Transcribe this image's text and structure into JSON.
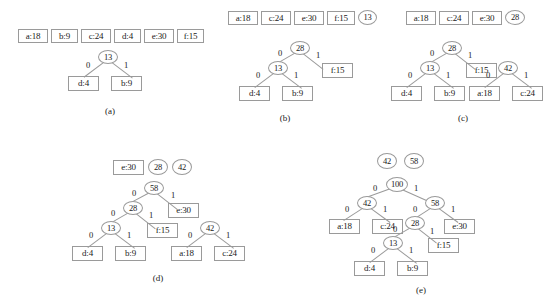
{
  "figure": {
    "width": 545,
    "height": 304,
    "colors": {
      "stroke": "#9a9a9a",
      "text": "#1a1a1a",
      "background": "#ffffff"
    }
  },
  "symbols": [
    {
      "label": "a:18",
      "char": "a",
      "freq": 18
    },
    {
      "label": "b:9",
      "char": "b",
      "freq": 9
    },
    {
      "label": "c:24",
      "char": "c",
      "freq": 24
    },
    {
      "label": "d:4",
      "char": "d",
      "freq": 4
    },
    {
      "label": "e:30",
      "char": "e",
      "freq": 30
    },
    {
      "label": "f:15",
      "char": "f",
      "freq": 15
    }
  ],
  "bits": {
    "zero": "0",
    "one": "1"
  },
  "panels": [
    {
      "id": "a",
      "caption": "(a)",
      "queue": [
        {
          "kind": "box",
          "label": "a:18"
        },
        {
          "kind": "box",
          "label": "b:9"
        },
        {
          "kind": "box",
          "label": "c:24"
        },
        {
          "kind": "box",
          "label": "d:4"
        },
        {
          "kind": "box",
          "label": "e:30"
        },
        {
          "kind": "box",
          "label": "f:15"
        }
      ],
      "trees": [
        {
          "root": "13",
          "nodes": [
            {
              "label": "13"
            }
          ],
          "leaves": [
            {
              "label": "d:4"
            },
            {
              "label": "b:9"
            }
          ]
        }
      ]
    },
    {
      "id": "b",
      "caption": "(b)",
      "queue": [
        {
          "kind": "box",
          "label": "a:18"
        },
        {
          "kind": "box",
          "label": "c:24"
        },
        {
          "kind": "box",
          "label": "e:30"
        },
        {
          "kind": "box",
          "label": "f:15"
        },
        {
          "kind": "node",
          "label": "13"
        }
      ],
      "trees": [
        {
          "root": "28",
          "nodes": [
            {
              "label": "28"
            },
            {
              "label": "13"
            }
          ],
          "leaves": [
            {
              "label": "d:4"
            },
            {
              "label": "b:9"
            },
            {
              "label": "f:15"
            }
          ]
        }
      ]
    },
    {
      "id": "c",
      "caption": "(c)",
      "queue": [
        {
          "kind": "box",
          "label": "a:18"
        },
        {
          "kind": "box",
          "label": "c:24"
        },
        {
          "kind": "box",
          "label": "e:30"
        },
        {
          "kind": "node",
          "label": "28"
        }
      ],
      "trees": [
        {
          "root": "28",
          "nodes": [
            {
              "label": "28"
            },
            {
              "label": "13"
            }
          ],
          "leaves": [
            {
              "label": "d:4"
            },
            {
              "label": "b:9"
            },
            {
              "label": "f:15"
            }
          ]
        },
        {
          "root": "42",
          "nodes": [
            {
              "label": "42"
            }
          ],
          "leaves": [
            {
              "label": "a:18"
            },
            {
              "label": "c:24"
            }
          ]
        }
      ]
    },
    {
      "id": "d",
      "caption": "(d)",
      "queue": [
        {
          "kind": "box",
          "label": "e:30"
        },
        {
          "kind": "node",
          "label": "28"
        },
        {
          "kind": "node",
          "label": "42"
        }
      ],
      "trees": [
        {
          "root": "58",
          "nodes": [
            {
              "label": "58"
            },
            {
              "label": "28"
            },
            {
              "label": "13"
            }
          ],
          "leaves": [
            {
              "label": "d:4"
            },
            {
              "label": "b:9"
            },
            {
              "label": "f:15"
            },
            {
              "label": "e:30"
            }
          ]
        },
        {
          "root": "42",
          "nodes": [
            {
              "label": "42"
            }
          ],
          "leaves": [
            {
              "label": "a:18"
            },
            {
              "label": "c:24"
            }
          ]
        }
      ]
    },
    {
      "id": "e",
      "caption": "(e)",
      "queue": [
        {
          "kind": "node",
          "label": "42"
        },
        {
          "kind": "node",
          "label": "58"
        }
      ],
      "trees": [
        {
          "root": "100",
          "nodes": [
            {
              "label": "100"
            },
            {
              "label": "42"
            },
            {
              "label": "58"
            },
            {
              "label": "28"
            },
            {
              "label": "13"
            }
          ],
          "leaves": [
            {
              "label": "a:18"
            },
            {
              "label": "c:24"
            },
            {
              "label": "d:4"
            },
            {
              "label": "b:9"
            },
            {
              "label": "f:15"
            },
            {
              "label": "e:30"
            }
          ]
        }
      ]
    }
  ]
}
